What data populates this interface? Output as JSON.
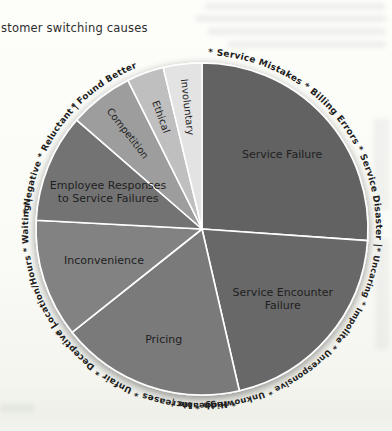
{
  "page": {
    "title": "stomer switching causes"
  },
  "chart_data": {
    "type": "pie",
    "title": "stomer switching causes",
    "legend": "none",
    "value_labels_shown": false,
    "label_color": "#1f1f1f",
    "ring_text_color": "#1c1c1c",
    "divider_color": "#ffffff",
    "slices": [
      {
        "label": "Service Failure",
        "descriptors": "* Service Mistakes * Billing Errors * Service Disaster |",
        "angle_deg": 94,
        "percent_est": 26.1,
        "color": "#626262",
        "label_rotated": false
      },
      {
        "label": "Service Encounter\nFailure",
        "descriptors": "* Uncaring * Impolite * Unresponsive * Unknowledgeable |",
        "angle_deg": 73,
        "percent_est": 20.3,
        "color": "#676767",
        "label_rotated": false
      },
      {
        "label": "Pricing",
        "descriptors": "* High * Increases * Unfair * Deceptive |",
        "angle_deg": 64.5,
        "percent_est": 17.9,
        "color": "#7a7a7a",
        "label_rotated": false
      },
      {
        "label": "Inconvenience",
        "descriptors": "* Location/Hours * Waiting |",
        "angle_deg": 41.5,
        "percent_est": 11.5,
        "color": "#828282",
        "label_rotated": false
      },
      {
        "label": "Employee Responses\nto Service Failures",
        "descriptors": "* Negative * Reluctant |",
        "angle_deg": 38,
        "percent_est": 10.6,
        "color": "#737373",
        "label_rotated": false
      },
      {
        "label": "Competition",
        "descriptors": "* Found Better",
        "angle_deg": 22.5,
        "percent_est": 6.3,
        "color": "#9d9d9d",
        "label_rotated": true
      },
      {
        "label": "Ethical",
        "descriptors": "",
        "angle_deg": 13,
        "percent_est": 3.6,
        "color": "#bfbfbf",
        "label_rotated": true
      },
      {
        "label": "Involuntary",
        "descriptors": "",
        "angle_deg": 13.5,
        "percent_est": 3.8,
        "color": "#e3e3e3",
        "label_rotated": true
      }
    ]
  }
}
